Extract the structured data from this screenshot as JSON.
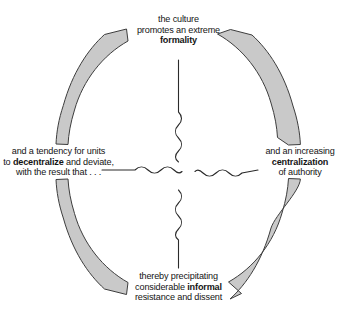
{
  "diagram": {
    "type": "cyclical-feedback-loop",
    "title": "",
    "background_color": "#ffffff",
    "arc_fill_color": "#c9c9c9",
    "arc_stroke_color": "#3d3d3d",
    "connector_color": "#2b2b2b",
    "text_color": "#141414",
    "nodes": [
      {
        "id": "top",
        "position": "top",
        "lines": [
          {
            "text": "the culture",
            "emphasis": false
          },
          {
            "text": "promotes an extreme",
            "emphasis": false
          },
          {
            "text": "formality",
            "emphasis": true
          }
        ]
      },
      {
        "id": "right",
        "position": "right",
        "lines": [
          {
            "text": "and an increasing",
            "emphasis": false
          },
          {
            "text": "centralization",
            "emphasis": true
          },
          {
            "text": "of authority",
            "emphasis": false
          }
        ]
      },
      {
        "id": "bottom",
        "position": "bottom",
        "lines": [
          {
            "text": "thereby precipitating",
            "emphasis": false
          },
          {
            "text": "considerable ",
            "emphasis": false,
            "trailing_bold": "informal"
          },
          {
            "text": "resistance and dissent",
            "emphasis": false
          }
        ]
      },
      {
        "id": "left",
        "position": "left",
        "lines": [
          {
            "text": "and a tendency for units",
            "emphasis": false
          },
          {
            "text": "to ",
            "emphasis": false,
            "bold_word": "decentralize",
            "after_bold": " and deviate,"
          },
          {
            "text": "with the result that . . .",
            "emphasis": false
          }
        ]
      }
    ],
    "arcs": [
      {
        "id": "arc-top-right",
        "from": "top",
        "to": "right",
        "arrowhead_at": "end",
        "direction": "clockwise"
      },
      {
        "id": "arc-right-bottom",
        "from": "right",
        "to": "bottom",
        "arrowhead_at": "end",
        "direction": "clockwise"
      },
      {
        "id": "arc-bottom-left",
        "from": "bottom",
        "to": "left",
        "arrowhead_at": "end",
        "direction": "clockwise"
      },
      {
        "id": "arc-left-top",
        "from": "left",
        "to": "top",
        "arrowhead_at": "end",
        "direction": "clockwise"
      }
    ],
    "connectors": [
      {
        "id": "connector-top",
        "orientation": "vertical",
        "style": "line-then-squiggle"
      },
      {
        "id": "connector-right",
        "orientation": "horizontal",
        "style": "squiggle-then-line"
      },
      {
        "id": "connector-bottom",
        "orientation": "vertical",
        "style": "squiggle-then-line"
      },
      {
        "id": "connector-left",
        "orientation": "horizontal",
        "style": "line-then-squiggle"
      }
    ]
  },
  "text": {
    "top": {
      "line1": "the culture",
      "line2": "promotes an extreme",
      "line3": "formality"
    },
    "right": {
      "line1": "and an increasing",
      "line2": "centralization",
      "line3": "of authority"
    },
    "bottom": {
      "line1": "thereby precipitating",
      "line2a": "considerable ",
      "line2b": "informal",
      "line3": "resistance and dissent"
    },
    "left": {
      "line1": "and a tendency for units",
      "line2a": "to ",
      "line2b": "decentralize",
      "line2c": " and deviate,",
      "line3": "with the result that . . ."
    }
  }
}
